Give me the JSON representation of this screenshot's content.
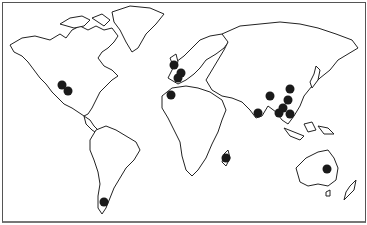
{
  "map": {
    "type": "world-outline-map",
    "marker_color": "#1a1a1a",
    "outline_color": "#222222",
    "background": "#ffffff",
    "markers": [
      {
        "region": "North America (west)",
        "x": 62,
        "y": 85
      },
      {
        "region": "North America (west)",
        "x": 68,
        "y": 91
      },
      {
        "region": "Europe (British Isles)",
        "x": 174,
        "y": 65
      },
      {
        "region": "Europe (central)",
        "x": 181,
        "y": 73
      },
      {
        "region": "Europe (central)",
        "x": 178,
        "y": 78
      },
      {
        "region": "Iberia / NW Africa",
        "x": 171,
        "y": 95
      },
      {
        "region": "China (north)",
        "x": 290,
        "y": 89
      },
      {
        "region": "China (west)",
        "x": 270,
        "y": 96
      },
      {
        "region": "China (east)",
        "x": 288,
        "y": 100
      },
      {
        "region": "China (south)",
        "x": 283,
        "y": 108
      },
      {
        "region": "SE Asia",
        "x": 279,
        "y": 113
      },
      {
        "region": "SE Asia",
        "x": 290,
        "y": 114
      },
      {
        "region": "India",
        "x": 258,
        "y": 113
      },
      {
        "region": "Madagascar",
        "x": 226,
        "y": 158
      },
      {
        "region": "Australia (east)",
        "x": 327,
        "y": 169
      },
      {
        "region": "South America (Patagonia)",
        "x": 104,
        "y": 202
      }
    ]
  }
}
